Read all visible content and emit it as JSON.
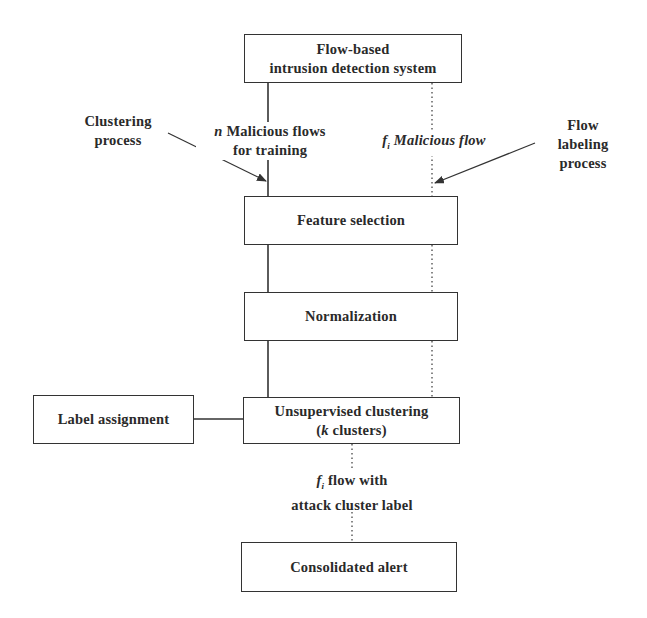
{
  "diagram": {
    "type": "flowchart",
    "nodes": {
      "ids": {
        "lines": [
          "Flow-based",
          "intrusion detection system"
        ]
      },
      "feature_selection": {
        "label": "Feature selection"
      },
      "normalization": {
        "label": "Normalization"
      },
      "clustering": {
        "line1": "Unsupervised clustering",
        "line2_open": "(",
        "line2_var": "k",
        "line2_rest": " clusters)"
      },
      "label_assignment": {
        "label": "Label assignment"
      },
      "consolidated_alert": {
        "label": "Consolidated alert"
      }
    },
    "annotations": {
      "clustering_process": {
        "lines": [
          "Clustering",
          "process"
        ]
      },
      "flow_labeling_process": {
        "lines": [
          "Flow",
          "labeling",
          "process"
        ]
      },
      "training_flows": {
        "var": "n",
        "line1_rest": " Malicious flows",
        "line2": "for training"
      },
      "malicious_flow": {
        "var": "f",
        "sub": "i",
        "rest": " Malicious flow"
      },
      "attack_label_flow": {
        "var": "f",
        "sub": "i",
        "line1_rest": " flow with",
        "line2": "attack cluster label"
      }
    },
    "edges": [
      {
        "from": "ids",
        "to": "feature_selection",
        "style": "solid",
        "path": "training"
      },
      {
        "from": "feature_selection",
        "to": "normalization",
        "style": "solid",
        "path": "training"
      },
      {
        "from": "normalization",
        "to": "clustering",
        "style": "solid",
        "path": "training"
      },
      {
        "from": "ids",
        "to": "feature_selection",
        "style": "dotted",
        "path": "labeling"
      },
      {
        "from": "feature_selection",
        "to": "normalization",
        "style": "dotted",
        "path": "labeling"
      },
      {
        "from": "normalization",
        "to": "clustering",
        "style": "dotted",
        "path": "labeling"
      },
      {
        "from": "clustering",
        "to": "consolidated_alert",
        "style": "dotted",
        "path": "labeling"
      },
      {
        "from": "label_assignment",
        "to": "clustering",
        "style": "solid"
      }
    ]
  }
}
